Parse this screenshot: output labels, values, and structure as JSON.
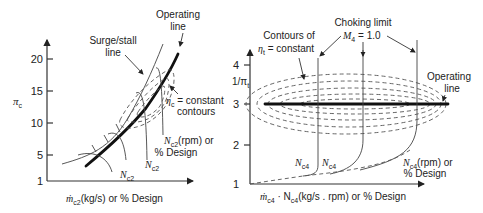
{
  "left_map": {
    "title": "Compressor map",
    "y_axis": {
      "symbol": "π",
      "subscript": "c",
      "ticks": [
        "20",
        "15",
        "10",
        "5",
        "1"
      ]
    },
    "x_axis": {
      "label_prefix": "ṁ",
      "label_sub": "c2",
      "label_suffix": "(kg/s) or % Design"
    },
    "labels": {
      "operating_line_1": "Operating",
      "operating_line_2": "line",
      "surge_line_1": "Surge/stall",
      "surge_line_2": "line",
      "efficiency_symbol": "η",
      "efficiency_sub": "c",
      "efficiency_1": " = constant",
      "efficiency_2": "contours",
      "speed_symbol": "N",
      "speed_sub": "c2",
      "speed_rpm": "(rpm) or",
      "speed_design": "% Design"
    }
  },
  "right_map": {
    "title": "Turbine map",
    "y_axis": {
      "label": "1/π",
      "subscript": "t",
      "ticks": [
        "4",
        "3",
        "2",
        "1"
      ]
    },
    "x_axis": {
      "prefix": "ṁ",
      "prefix_sub": "c4",
      "mid": " · N",
      "mid_sub": "c4",
      "suffix": "(kg/s . rpm) or % Design"
    },
    "labels": {
      "contours_1": "Contours of",
      "contours_symbol": "η",
      "contours_sub": "t",
      "contours_2": " = constant",
      "choking_1": "Choking limit",
      "choking_symbol": "M",
      "choking_sub": "4",
      "choking_2": " = 1.0",
      "operating_line_1": "Operating",
      "operating_line_2": "line",
      "speed_symbol": "N",
      "speed_sub": "c4",
      "speed_rpm": "(rpm) or",
      "speed_design": "% Design"
    }
  }
}
